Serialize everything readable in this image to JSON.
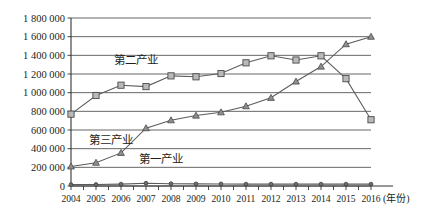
{
  "chart_data": {
    "type": "line",
    "title": "",
    "xlabel": "(年份)",
    "ylabel": "",
    "grid": true,
    "legend_position": "inline-annotations",
    "categories": [
      "2004",
      "2005",
      "2006",
      "2007",
      "2008",
      "2009",
      "2010",
      "2011",
      "2012",
      "2013",
      "2014",
      "2015",
      "2016"
    ],
    "x": [
      2004,
      2005,
      2006,
      2007,
      2008,
      2009,
      2010,
      2011,
      2012,
      2013,
      2014,
      2015,
      2016
    ],
    "ylim": [
      0,
      1800000
    ],
    "ytick_values": [
      0,
      200000,
      400000,
      600000,
      800000,
      1000000,
      1200000,
      1400000,
      1600000,
      1800000
    ],
    "ytick_labels": [
      "0",
      "200 000",
      "400 000",
      "600 000",
      "800 000",
      "1 000 000",
      "1 200 000",
      "1 400 000",
      "1 600 000",
      "1 800 000"
    ],
    "series": [
      {
        "name": "第二产业",
        "marker": "square",
        "values": [
          770000,
          970000,
          1080000,
          1065000,
          1180000,
          1170000,
          1205000,
          1320000,
          1395000,
          1350000,
          1395000,
          1150000,
          710000
        ]
      },
      {
        "name": "第三产业",
        "marker": "triangle",
        "values": [
          210000,
          250000,
          355000,
          620000,
          705000,
          755000,
          790000,
          855000,
          945000,
          1120000,
          1280000,
          1520000,
          1600000
        ]
      },
      {
        "name": "第一产业",
        "marker": "dot",
        "values": [
          15000,
          16000,
          20000,
          30000,
          25000,
          23000,
          22000,
          20000,
          20000,
          20000,
          20000,
          20000,
          20000
        ]
      }
    ],
    "annotations": [
      {
        "text": "第二产业",
        "x_year": 2006.6,
        "y_value": 1310000
      },
      {
        "text": "第三产业",
        "x_year": 2005.6,
        "y_value": 455000
      },
      {
        "text": "第一产业",
        "x_year": 2007.6,
        "y_value": 250000
      }
    ]
  }
}
